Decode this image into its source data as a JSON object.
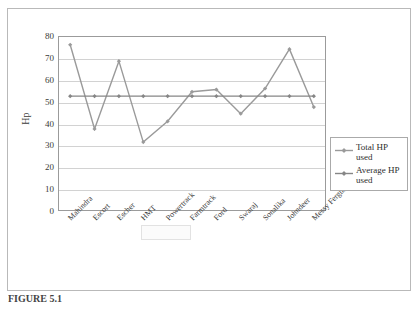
{
  "chart_data": {
    "type": "line",
    "title": "",
    "xlabel": "",
    "ylabel": "Hp",
    "ylim": [
      0,
      80
    ],
    "ytick_step": 10,
    "yticks": [
      "80",
      "70",
      "60",
      "50",
      "40",
      "30",
      "20",
      "10",
      "0"
    ],
    "grid": true,
    "legend_position": "right",
    "categories": [
      "Mahindra",
      "Escort",
      "Escher",
      "HMT",
      "Powertrack",
      "Farmtrack",
      "Ford",
      "Swaraj",
      "Sonalika",
      "Johndeer",
      "Messy Ferguson"
    ],
    "series": [
      {
        "name": "Total HP used",
        "color": "#9a9a9a",
        "values": [
          76,
          37.5,
          68.5,
          31.5,
          41,
          54.5,
          55.5,
          44.5,
          56,
          74,
          47.5
        ]
      },
      {
        "name": "Average HP used",
        "color": "#868686",
        "values": [
          52.5,
          52.5,
          52.5,
          52.5,
          52.5,
          52.5,
          52.5,
          52.5,
          52.5,
          52.5,
          52.5
        ]
      }
    ]
  },
  "legend": {
    "entries": [
      {
        "label": "Total HP used"
      },
      {
        "label": "Average HP used"
      }
    ]
  },
  "watermark": {
    "text": ""
  },
  "caption": {
    "text": "FIGURE 5.1"
  }
}
